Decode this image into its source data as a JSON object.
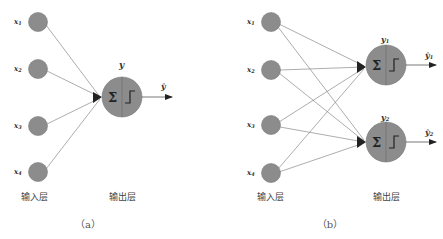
{
  "colors": {
    "node_fill": "#8c8c8c",
    "node_stroke": "#7a7a7a",
    "edge": "#8a8a8a",
    "arrow": "#222222",
    "background": "#ffffff"
  },
  "panel_a": {
    "caption": "（a）",
    "input_layer_label": "输入层",
    "output_layer_label": "输出层",
    "inputs": [
      {
        "label": "x",
        "sub": "1"
      },
      {
        "label": "x",
        "sub": "2"
      },
      {
        "label": "x",
        "sub": "3"
      },
      {
        "label": "x",
        "sub": "4"
      }
    ],
    "output": {
      "sum_symbol": "Σ",
      "label": "y",
      "output_label": "ŷ"
    }
  },
  "panel_b": {
    "caption": "（b）",
    "input_layer_label": "输入层",
    "output_layer_label": "输出层",
    "inputs": [
      {
        "label": "x",
        "sub": "1"
      },
      {
        "label": "x",
        "sub": "2"
      },
      {
        "label": "x",
        "sub": "3"
      },
      {
        "label": "x",
        "sub": "4"
      }
    ],
    "outputs": [
      {
        "sum_symbol": "Σ",
        "label": "y",
        "sub": "1",
        "output_label": "ŷ",
        "output_sub": "1"
      },
      {
        "sum_symbol": "Σ",
        "label": "y",
        "sub": "2",
        "output_label": "ŷ",
        "output_sub": "2"
      }
    ]
  }
}
